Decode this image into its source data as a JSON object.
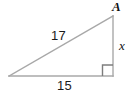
{
  "figure": {
    "kind": "right-triangle-diagram",
    "background_color": "#ffffff",
    "stroke_color": "#a0a0a0",
    "stroke_color_dark": "#808080",
    "text_color": "#1a1a1a",
    "canvas": {
      "width": 136,
      "height": 97
    }
  },
  "labels": {
    "vertex_a": "A",
    "hypotenuse": "17",
    "vertical_leg": "x",
    "base": "15"
  },
  "geometry": {
    "vertices": {
      "left": {
        "x": 9,
        "y": 76
      },
      "bottom_right": {
        "x": 113,
        "y": 76
      },
      "apex": {
        "x": 113,
        "y": 16
      }
    },
    "right_angle_marker": {
      "corner_x": 113,
      "corner_y": 76,
      "size": 11
    },
    "sides": [
      {
        "name": "hypotenuse",
        "label": "17",
        "from": "left",
        "to": "apex"
      },
      {
        "name": "vertical-leg",
        "label": "x",
        "from": "apex",
        "to": "bottom_right"
      },
      {
        "name": "base",
        "label": "15",
        "from": "left",
        "to": "bottom_right"
      }
    ]
  }
}
